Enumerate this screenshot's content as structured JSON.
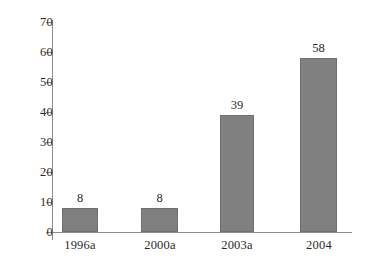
{
  "chart_data": {
    "type": "bar",
    "title": "",
    "subtitle": "",
    "xlabel": "",
    "ylabel": "",
    "categories": [
      "1996a",
      "2000a",
      "2003a",
      "2004"
    ],
    "values": [
      8,
      8,
      39,
      58
    ],
    "data_labels": [
      "8",
      "8",
      "39",
      "58"
    ],
    "series": [
      {
        "name": "",
        "values": [
          8,
          8,
          39,
          58
        ]
      }
    ],
    "ylim": [
      0,
      70
    ],
    "ytick_values": [
      70,
      60,
      50,
      40,
      30,
      20,
      10,
      0
    ],
    "ytick_labels": [
      "70",
      "60",
      "50",
      "40",
      "30",
      "20",
      "10",
      "0"
    ],
    "ytick_interval": 10,
    "grid": false,
    "legend": false,
    "legend_position": "none",
    "annotations": [],
    "colors": {
      "bar_fill": "#808080",
      "bar_stroke": "#6f6f6f",
      "axis": "#8d8d8d",
      "text": "#2b2b2b",
      "background": "#ffffff"
    }
  }
}
